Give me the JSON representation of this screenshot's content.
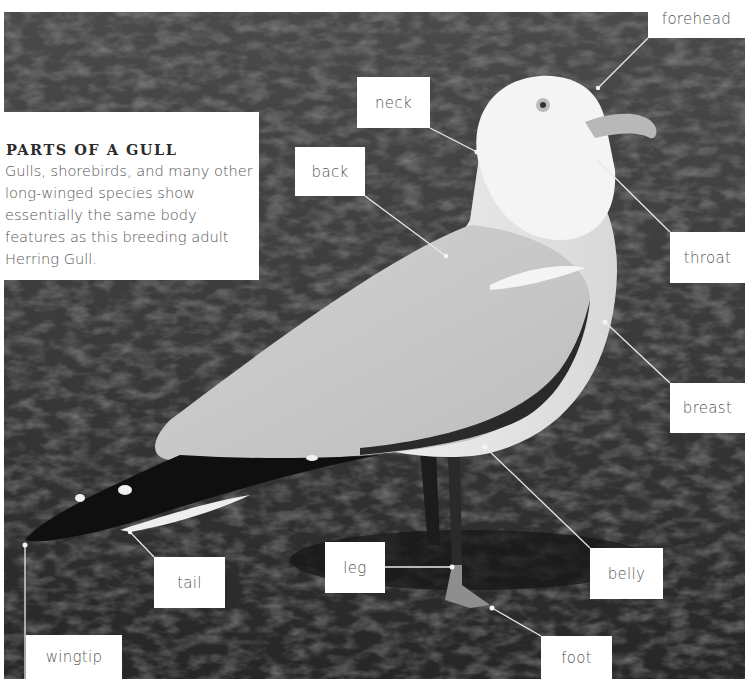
{
  "intro": {
    "title": "PARTS OF A GULL",
    "body": "Gulls, shorebirds, and many other long-winged species show essentially the same body features as this breeding adult Herring Gull."
  },
  "labels": {
    "forehead": "forehead",
    "neck": "neck",
    "back": "back",
    "throat": "throat",
    "breast": "breast",
    "belly": "belly",
    "leg": "leg",
    "foot": "foot",
    "tail": "tail",
    "wingtip": "wingtip"
  },
  "colors": {
    "background_grass": "#3a3a3a",
    "label_bg": "#ffffff",
    "label_text": "#555555",
    "leader_line": "#e8e8e8"
  }
}
